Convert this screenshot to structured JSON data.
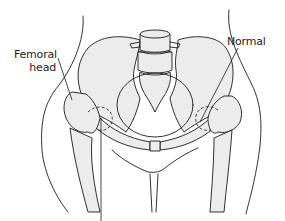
{
  "figure": {
    "labels": {
      "femoral_head": "Femoral\nhead",
      "femoral_head_line1": "Femoral",
      "femoral_head_line2": "head",
      "normal": "Normal"
    },
    "colors": {
      "outline": "#1a1a1a",
      "bone_fill": "#ececec",
      "background": "#ffffff"
    }
  }
}
